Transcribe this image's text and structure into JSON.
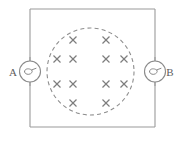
{
  "figure": {
    "title": "",
    "background_color": "#ffffff",
    "line_color": "#9a9a9a",
    "cross_color": "#7e7e7e",
    "dashed_color": "#8e8e8e",
    "label_color": "#5d5d5d"
  },
  "frame": {
    "name": "circuit-rectangle",
    "x": 30,
    "y": 9,
    "width": 125,
    "height": 118
  },
  "field_region": {
    "name": "magnetic-field-region",
    "shape": "dashed-circle",
    "center_x": 90.5,
    "center_y": 71.5,
    "radius": 43.5,
    "field_direction": "into-page",
    "symbol": "×"
  },
  "field_marks": {
    "symbol": "cross",
    "rows": [
      {
        "y": 40,
        "xs": [
          73,
          106
        ]
      },
      {
        "y": 59,
        "xs": [
          57,
          73,
          106,
          124
        ]
      },
      {
        "y": 84,
        "xs": [
          57,
          73,
          106,
          124
        ]
      },
      {
        "y": 103,
        "xs": [
          73,
          106
        ]
      }
    ],
    "total_count": 12
  },
  "meters": [
    {
      "id": "meter-a",
      "label": "A",
      "label_x": 13,
      "label_y": 75,
      "center_x": 30,
      "center_y": 71.5,
      "radius": 10.5,
      "glyph": "galvanometer-loop",
      "side": "left"
    },
    {
      "id": "meter-b",
      "label": "B",
      "label_x": 168,
      "label_y": 75,
      "center_x": 155,
      "center_y": 71.5,
      "radius": 10.5,
      "glyph": "galvanometer-loop",
      "side": "right"
    }
  ]
}
